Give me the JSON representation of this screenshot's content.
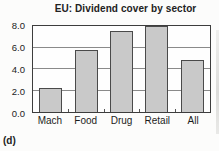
{
  "figure_label": "(d)",
  "chart_data": {
    "type": "bar",
    "title": "EU: Dividend cover by sector",
    "categories": [
      "Mach",
      "Food",
      "Drug",
      "Retail",
      "All"
    ],
    "values": [
      2.2,
      5.8,
      7.5,
      8.0,
      4.8
    ],
    "xlabel": "",
    "ylabel": "",
    "ylim": [
      0,
      8
    ],
    "yticks": [
      0.0,
      2.0,
      4.0,
      6.0,
      8.0
    ],
    "ytick_labels": [
      "0.0",
      "2.0",
      "4.0",
      "6.0",
      "8.0"
    ],
    "grid": true,
    "legend": false,
    "colors": {
      "bar_fill": "#c9c9c9",
      "bar_border": "#4a4a4a",
      "gridline": "#8a8a8a",
      "plot_border": "#3d3d3d",
      "text": "#222222"
    }
  }
}
